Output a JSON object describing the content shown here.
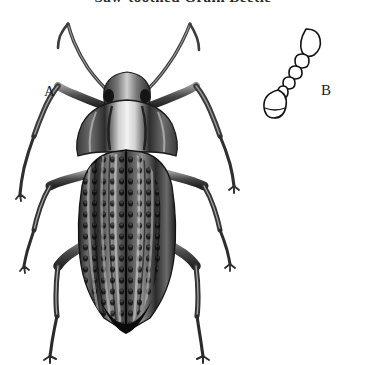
{
  "plate": {
    "title": "Saw-toothed Grain Beetle",
    "background_color": "#ffffff",
    "ink_color": "#1a1a1a",
    "width": 366,
    "height": 365
  },
  "figures": [
    {
      "key": "A",
      "label": "A",
      "name": "whole-beetle-dorsal-view",
      "description": "Dorsal habitus of a darkling beetle: head with two long filiform antennae, broad pronotum, costate elytra bearing rows of deep punctures, three pairs of long slender legs."
    },
    {
      "key": "B",
      "label": "B",
      "name": "antenna-detail",
      "description": "Enlarged detail of a single antenna: elongate oval scape, short pedicel, chain of small bead-like flagellomeres and an elongate terminal club."
    }
  ],
  "antenna_detail": {
    "segment_count": 9,
    "club_shape": "elongate-oval",
    "base_shape": "elongate-oval"
  },
  "colors": {
    "paper": "#ffffff",
    "ink": "#1a1a1a",
    "body_dark": "#2a2a2a",
    "body_mid": "#585858",
    "body_light": "#b9b9b9",
    "highlight": "#e8e8e8"
  }
}
